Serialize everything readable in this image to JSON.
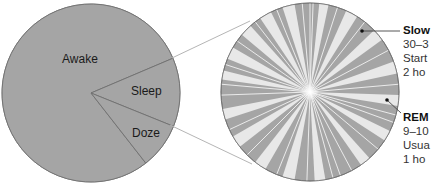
{
  "colors": {
    "slice_fill": "#a5a5a5",
    "slice_stroke": "#707070",
    "light_wedge": "#e8e8e8",
    "connector": "#b5b5b5",
    "leader": "#444444"
  },
  "left_pie": {
    "center": [
      91,
      93
    ],
    "radius": 89,
    "slices": [
      {
        "label": "Awake",
        "start_deg": 52,
        "end_deg": 337,
        "label_pos": [
          62,
          52
        ]
      },
      {
        "label": "Sleep",
        "start_deg": -23,
        "end_deg": 22,
        "label_pos": [
          131,
          84
        ]
      },
      {
        "label": "Doze",
        "start_deg": 22,
        "end_deg": 52,
        "label_pos": [
          132,
          126
        ]
      }
    ]
  },
  "right_pie": {
    "center": [
      310,
      92
    ],
    "radius": 89,
    "light_wedges_deg": [
      [
        -172,
        -166
      ],
      [
        -158,
        -150
      ],
      [
        -140,
        -132
      ],
      [
        -124,
        -116
      ],
      [
        -108,
        -100
      ],
      [
        -84,
        -78
      ],
      [
        -66,
        -58
      ],
      [
        -44,
        -36
      ],
      [
        -20,
        -12
      ],
      [
        2,
        9
      ],
      [
        26,
        33
      ],
      [
        48,
        55
      ],
      [
        80,
        87
      ],
      [
        100,
        108
      ],
      [
        120,
        128
      ],
      [
        142,
        150
      ],
      [
        162,
        169
      ]
    ],
    "white_lines_deg": [
      -175,
      -162,
      -145,
      -128,
      -112,
      -95,
      -90,
      -88,
      -72,
      -52,
      -28,
      -5,
      15,
      20,
      40,
      62,
      70,
      75,
      92,
      112,
      135,
      155,
      178
    ]
  },
  "connectors": [
    {
      "from": [
        172,
        58
      ],
      "to": [
        250,
        21
      ]
    },
    {
      "from": [
        170,
        125
      ],
      "to": [
        252,
        164
      ]
    }
  ],
  "callouts": [
    {
      "title": "Slow",
      "lines": [
        "30–3",
        "Start",
        "2 ho"
      ],
      "dot": [
        362,
        31
      ],
      "leader": [
        [
          362,
          31
        ],
        [
          400,
          31
        ]
      ],
      "top": 23
    },
    {
      "title": "REM",
      "lines": [
        "9–10",
        "Usua",
        "1 ho"
      ],
      "dot": [
        387,
        100
      ],
      "leader": [
        [
          387,
          100
        ],
        [
          401,
          113
        ]
      ],
      "top": 110
    }
  ]
}
